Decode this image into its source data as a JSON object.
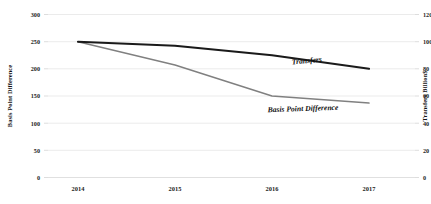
{
  "chart_data": {
    "type": "line",
    "title": "",
    "xlabel": "",
    "categories": [
      "2014",
      "2015",
      "2016",
      "2017"
    ],
    "grid": true,
    "legend_position": "inline-annotations",
    "axes": {
      "left": {
        "label": "Basis Point Difference",
        "ticks": [
          "0",
          "50",
          "100",
          "150",
          "200",
          "250",
          "300"
        ],
        "ylim": [
          0,
          300
        ]
      },
      "right": {
        "label": "Transfers Billion$",
        "ticks": [
          "0",
          "20",
          "40",
          "60",
          "80",
          "100",
          "120"
        ],
        "ylim": [
          0,
          120
        ]
      }
    },
    "series": [
      {
        "name": "Transfers",
        "axis": "right",
        "color": "#1a1a1a",
        "width": 2.1,
        "values": [
          100,
          97,
          90,
          80
        ],
        "annotation": "Transfers"
      },
      {
        "name": "Basis Point Difference",
        "axis": "left",
        "color": "#808080",
        "width": 1.5,
        "values": [
          250,
          207,
          150,
          137
        ],
        "annotation": "Basis Point Difference"
      }
    ]
  },
  "annotations": {
    "transfers_label": "Transfers",
    "basis_label": "Basis Point Difference"
  },
  "ticks": {
    "left": {
      "t0": "300",
      "t1": "250",
      "t2": "200",
      "t3": "150",
      "t4": "100",
      "t5": "50",
      "t6": "0"
    },
    "right": {
      "t0": "120",
      "t1": "100",
      "t2": "80",
      "t3": "60",
      "t4": "40",
      "t5": "20",
      "t6": "0"
    },
    "x": {
      "c0": "2014",
      "c1": "2015",
      "c2": "2016",
      "c3": "2017"
    }
  },
  "axis_titles": {
    "left": "Basis Point Difference",
    "right": "Transfers Billion$"
  }
}
